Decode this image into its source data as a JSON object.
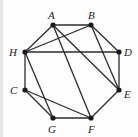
{
  "diagram": {
    "type": "graph",
    "vertices": [
      {
        "id": "A",
        "label": "A",
        "x": 53,
        "y": 25,
        "lx": 48,
        "ly": 19
      },
      {
        "id": "B",
        "label": "B",
        "x": 91,
        "y": 25,
        "lx": 88,
        "ly": 19
      },
      {
        "id": "D",
        "label": "D",
        "x": 119,
        "y": 52,
        "lx": 124,
        "ly": 56
      },
      {
        "id": "E",
        "label": "E",
        "x": 119,
        "y": 90,
        "lx": 124,
        "ly": 98
      },
      {
        "id": "F",
        "label": "F",
        "x": 91,
        "y": 118,
        "lx": 88,
        "ly": 133
      },
      {
        "id": "G",
        "label": "G",
        "x": 53,
        "y": 118,
        "lx": 48,
        "ly": 133
      },
      {
        "id": "C",
        "label": "C",
        "x": 25,
        "y": 90,
        "lx": 10,
        "ly": 94
      },
      {
        "id": "H",
        "label": "H",
        "x": 25,
        "y": 52,
        "lx": 9,
        "ly": 56
      }
    ],
    "edges": [
      [
        "A",
        "B"
      ],
      [
        "B",
        "D"
      ],
      [
        "D",
        "E"
      ],
      [
        "E",
        "F"
      ],
      [
        "F",
        "G"
      ],
      [
        "G",
        "C"
      ],
      [
        "C",
        "H"
      ],
      [
        "H",
        "A"
      ],
      [
        "H",
        "B"
      ],
      [
        "H",
        "D"
      ],
      [
        "A",
        "E"
      ],
      [
        "A",
        "F"
      ],
      [
        "B",
        "E"
      ],
      [
        "H",
        "G"
      ],
      [
        "C",
        "F"
      ]
    ],
    "colors": {
      "edge": "#2b2b2b",
      "vertex": "#1a1a1a",
      "label": "#222222"
    }
  }
}
